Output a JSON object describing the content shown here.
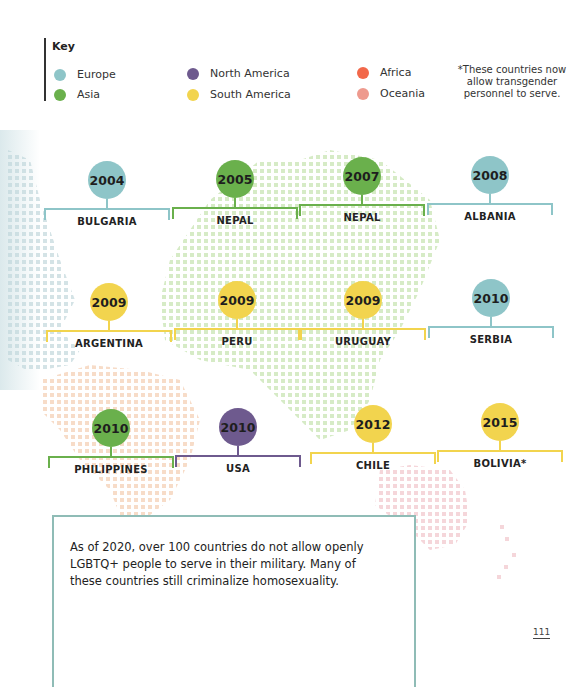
{
  "colors": {
    "europe": "#8ec5c8",
    "asia": "#6ab04c",
    "north_america": "#6e5a8e",
    "south_america": "#f2d44e",
    "africa": "#f2684a",
    "oceania": "#ee9a8e",
    "fact_border": "#8fbcb6",
    "map_asia_dots": "#d6ebc6",
    "map_africa_dots": "#f7dcc8",
    "map_oceania_dots": "#f5d6da",
    "map_europe_dots": "#d4e3e6"
  },
  "key": {
    "title": "Key",
    "items": [
      {
        "label": "Europe",
        "color": "#8ec5c8"
      },
      {
        "label": "Asia",
        "color": "#6ab04c"
      },
      {
        "label": "North America",
        "color": "#6e5a8e"
      },
      {
        "label": "South America",
        "color": "#f2d44e"
      },
      {
        "label": "Africa",
        "color": "#f2684a"
      },
      {
        "label": "Oceania",
        "color": "#ee9a8e"
      }
    ],
    "note": "*These countries now allow transgender personnel to serve."
  },
  "timeline": [
    {
      "year": "2004",
      "country": "BULGARIA",
      "region": "Europe",
      "color": "#8ec5c8"
    },
    {
      "year": "2005",
      "country": "THAILAND",
      "region": "Asia",
      "color": "#6ab04c"
    },
    {
      "year": "2007",
      "country": "NEPAL",
      "region": "Asia",
      "color": "#6ab04c"
    },
    {
      "year": "2008",
      "country": "ALBANIA",
      "region": "Europe",
      "color": "#8ec5c8"
    },
    {
      "year": "2009",
      "country": "ARGENTINA",
      "region": "South America",
      "color": "#f2d44e"
    },
    {
      "year": "2009",
      "country": "PERU",
      "region": "South America",
      "color": "#f2d44e"
    },
    {
      "year": "2009",
      "country": "URUGUAY",
      "region": "South America",
      "color": "#f2d44e"
    },
    {
      "year": "2010",
      "country": "SERBIA",
      "region": "Europe",
      "color": "#8ec5c8"
    },
    {
      "year": "2010",
      "country": "PHILIPPINES",
      "region": "Asia",
      "color": "#6ab04c"
    },
    {
      "year": "2010",
      "country": "USA",
      "region": "North America",
      "color": "#6e5a8e"
    },
    {
      "year": "2012",
      "country": "CHILE",
      "region": "South America",
      "color": "#f2d44e"
    },
    {
      "year": "2015",
      "country": "BOLIVIA*",
      "region": "South America",
      "color": "#f2d44e"
    }
  ],
  "fact_box": {
    "text": "As of 2020, over 100 countries do not allow openly LGBTQ+ people to serve in their military. Many of these countries still criminalize homosexuality."
  },
  "page_number": "111"
}
